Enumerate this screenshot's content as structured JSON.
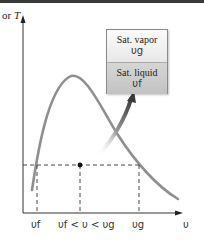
{
  "figure": {
    "y_axis_label": {
      "prefix": "or",
      "var": "T"
    },
    "x_axis_label": "υ",
    "x_ticks": [
      {
        "label": "υf",
        "x": 37
      },
      {
        "label": "υf < υ < υg",
        "x": 80
      },
      {
        "label": "υg",
        "x": 139
      }
    ],
    "box": {
      "top": {
        "title": "Sat. vapor",
        "symbol": "υg"
      },
      "bottom": {
        "title": "Sat. liquid",
        "symbol": "υf"
      }
    },
    "marker_point": {
      "x": 80,
      "y": 165
    },
    "colors": {
      "curve": "#8f8f8f",
      "axis": "#333333",
      "dash": "#333333",
      "arrow": "#555555"
    }
  }
}
